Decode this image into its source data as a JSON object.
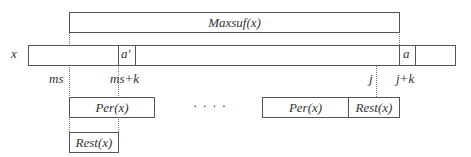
{
  "maxsuf": {
    "label": "Maxsuf(x)"
  },
  "string_row": {
    "name_label": "x",
    "cell_a_prime": "a'",
    "cell_a": "a"
  },
  "positions": {
    "ms": "ms",
    "ms_plus_k": "ms+k",
    "j": "j",
    "j_plus_k": "j+k"
  },
  "left_blocks": {
    "per": "Per(x)",
    "rest": "Rest(x)"
  },
  "ellipsis": "· · · ·",
  "right_blocks": {
    "per": "Per(x)",
    "rest": "Rest(x)"
  }
}
